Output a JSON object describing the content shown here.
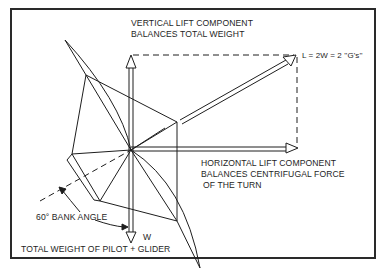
{
  "diagram": {
    "labels": {
      "vertical_line1": "VERTICAL LIFT COMPONENT",
      "vertical_line2": "BALANCES TOTAL WEIGHT",
      "lift_formula": "L = 2W = 2 ''G's''",
      "horizontal_line1": "HORIZONTAL LIFT COMPONENT",
      "horizontal_line2": "BALANCES CENTRIFUGAL FORCE",
      "horizontal_line3": "OF THE TURN",
      "bank_angle": "60° BANK ANGLE",
      "weight_symbol": "W",
      "weight_caption": "TOTAL WEIGHT OF PILOT + GLIDER"
    },
    "vectors": [
      {
        "name": "vertical-lift",
        "direction": "up"
      },
      {
        "name": "total-lift",
        "direction": "up-right",
        "magnitude": "2W"
      },
      {
        "name": "horizontal-lift",
        "direction": "right"
      },
      {
        "name": "weight",
        "direction": "down",
        "symbol": "W"
      }
    ],
    "bank_angle_deg": 60,
    "colors": {
      "line": "#1e1e1e",
      "background": "#ffffff"
    }
  }
}
